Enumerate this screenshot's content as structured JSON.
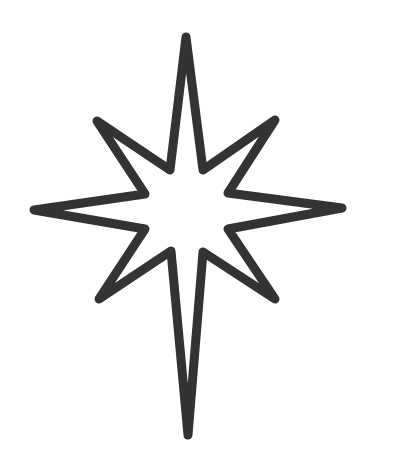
{
  "image": {
    "subject": "eight-pointed star outline",
    "background_color": "#ffffff",
    "stroke_color": "#333333",
    "stroke_width": 9,
    "points": "186,37 203,170 275,120 228,193 342,208 228,229 275,299 203,252 188,435 171,251 99,299 145,229 34,210 145,194 97,121 170,170"
  }
}
